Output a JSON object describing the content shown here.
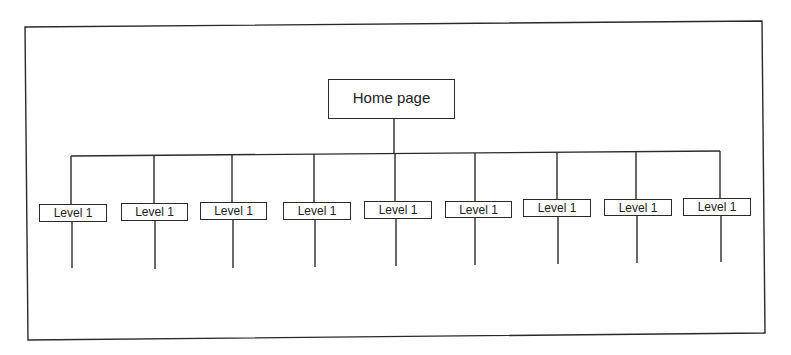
{
  "diagram": {
    "type": "site-hierarchy",
    "root": {
      "label": "Home page"
    },
    "level1": [
      {
        "label": "Level 1"
      },
      {
        "label": "Level 1"
      },
      {
        "label": "Level 1"
      },
      {
        "label": "Level 1"
      },
      {
        "label": "Level 1"
      },
      {
        "label": "Level 1"
      },
      {
        "label": "Level 1"
      },
      {
        "label": "Level 1"
      },
      {
        "label": "Level 1"
      }
    ],
    "colors": {
      "line": "#2a2a2a",
      "background": "#ffffff",
      "text": "#222222"
    }
  }
}
